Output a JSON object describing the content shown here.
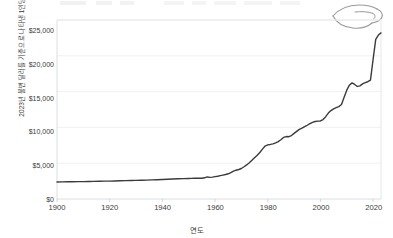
{
  "figure": {
    "hand_icon": "open-hand-icon",
    "background": "#ffffff"
  },
  "chart_data": {
    "type": "line",
    "title": "",
    "xlabel": "연도",
    "ylabel": "2023년 불변 달러를 기준으로 나타낸 1인당 지출",
    "xlim": [
      1900,
      2023
    ],
    "ylim": [
      0,
      25000
    ],
    "grid": true,
    "legend": null,
    "line_color": "#3b3b3b",
    "line_width": 1.4,
    "xticks": [
      1900,
      1920,
      1940,
      1960,
      1980,
      2000,
      2020
    ],
    "xtick_labels": [
      "1900",
      "1920",
      "1940",
      "1960",
      "1980",
      "2000",
      "2020"
    ],
    "yticks": [
      0,
      5000,
      10000,
      15000,
      20000,
      25000
    ],
    "ytick_labels": [
      "$0",
      "$5,000",
      "$10,000",
      "$15,000",
      "$20,000",
      "$25,000"
    ],
    "series": [
      {
        "name": "1인당 지출",
        "x": [
          1900,
          1902,
          1904,
          1906,
          1908,
          1910,
          1912,
          1914,
          1916,
          1918,
          1920,
          1922,
          1924,
          1926,
          1928,
          1930,
          1932,
          1934,
          1936,
          1938,
          1940,
          1942,
          1944,
          1946,
          1948,
          1950,
          1951,
          1952,
          1953,
          1954,
          1955,
          1956,
          1957,
          1958,
          1959,
          1960,
          1961,
          1962,
          1963,
          1964,
          1965,
          1966,
          1967,
          1968,
          1969,
          1970,
          1971,
          1972,
          1973,
          1974,
          1975,
          1976,
          1977,
          1978,
          1979,
          1980,
          1981,
          1982,
          1983,
          1984,
          1985,
          1986,
          1987,
          1988,
          1989,
          1990,
          1991,
          1992,
          1993,
          1994,
          1995,
          1996,
          1997,
          1998,
          1999,
          2000,
          2001,
          2002,
          2003,
          2004,
          2005,
          2006,
          2007,
          2008,
          2009,
          2010,
          2011,
          2012,
          2013,
          2014,
          2015,
          2016,
          2017,
          2018,
          2019,
          2020,
          2021,
          2022,
          2023
        ],
        "values": [
          2380,
          2390,
          2400,
          2410,
          2420,
          2430,
          2445,
          2460,
          2475,
          2490,
          2500,
          2520,
          2540,
          2560,
          2580,
          2600,
          2620,
          2640,
          2665,
          2690,
          2720,
          2760,
          2790,
          2820,
          2840,
          2870,
          2880,
          2890,
          2900,
          2890,
          2900,
          2960,
          3080,
          3020,
          3060,
          3120,
          3180,
          3260,
          3340,
          3420,
          3520,
          3700,
          3880,
          4020,
          4120,
          4260,
          4500,
          4760,
          5060,
          5400,
          5760,
          6100,
          6500,
          6960,
          7400,
          7560,
          7620,
          7700,
          7840,
          8020,
          8280,
          8600,
          8720,
          8700,
          8860,
          9160,
          9440,
          9720,
          9900,
          10100,
          10300,
          10520,
          10700,
          10820,
          10880,
          10900,
          11100,
          11500,
          12000,
          12350,
          12580,
          12760,
          12900,
          13200,
          14200,
          15200,
          15900,
          16220,
          16000,
          15720,
          15800,
          16080,
          16260,
          16380,
          16600,
          19500,
          22300,
          22900,
          23200
        ]
      }
    ]
  }
}
